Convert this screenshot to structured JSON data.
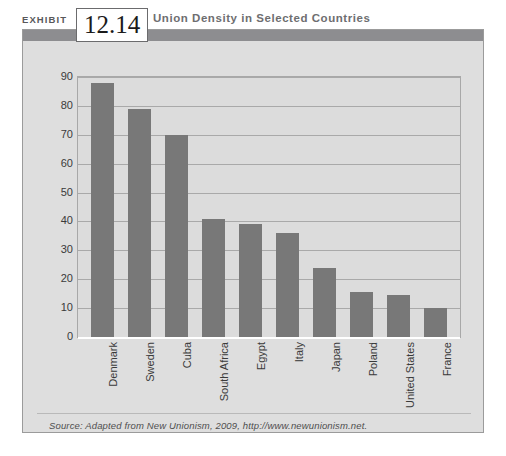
{
  "exhibit": {
    "label": "EXHIBIT",
    "number": "12.14",
    "title": "Union Density in Selected Countries"
  },
  "source_note": "Source: Adapted from New Unionism, 2009, http://www.newunionism.net.",
  "colors": {
    "bar": "#787878",
    "plot_background": "#dcdcdc",
    "panel_background": "#dedede",
    "header_band": "#8d8d90",
    "gridline": "#a9a9a9",
    "baseline": "#ffffff"
  },
  "chart_data": {
    "type": "bar",
    "title": "Union Density in Selected Countries",
    "xlabel": "",
    "ylabel": "",
    "ylim": [
      0,
      90
    ],
    "ytick_step": 10,
    "yticks": [
      0,
      10,
      20,
      30,
      40,
      50,
      60,
      70,
      80,
      90
    ],
    "grid": true,
    "legend": false,
    "categories": [
      "Denmark",
      "Sweden",
      "Cuba",
      "South Africa",
      "Egypt",
      "Italy",
      "Japan",
      "Poland",
      "United States",
      "France"
    ],
    "values": [
      88,
      79,
      70,
      41,
      39,
      36,
      24,
      15.5,
      14.5,
      10
    ]
  }
}
